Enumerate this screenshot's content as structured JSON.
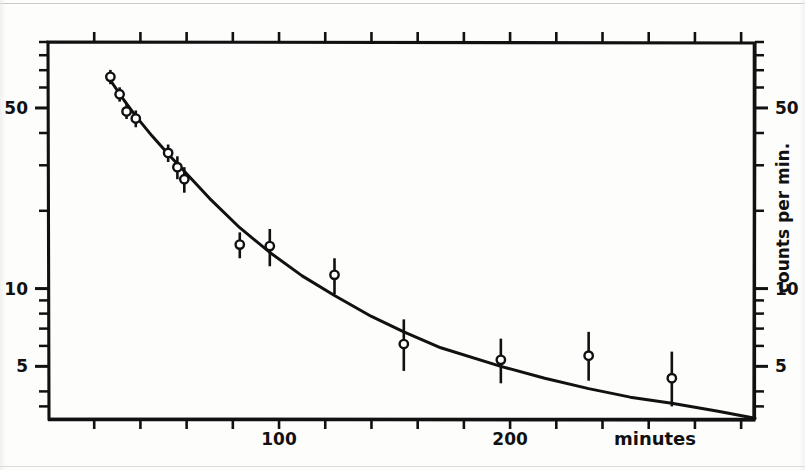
{
  "chart_data": {
    "type": "scatter",
    "title": "",
    "subtitle": "",
    "xlabel": "minutes",
    "ylabel": "counts per min.",
    "yscale": "log",
    "xscale": "linear",
    "grid": false,
    "legend": null,
    "xlim": [
      0,
      306
    ],
    "ylim": [
      3.1,
      90
    ],
    "x_ticks_labeled": [
      {
        "value": 100,
        "label": "100"
      },
      {
        "value": 200,
        "label": "200"
      }
    ],
    "x_ticks_minor": [
      20,
      40,
      60,
      80,
      100,
      120,
      140,
      160,
      180,
      200,
      220,
      240,
      260,
      280,
      300
    ],
    "y_ticks_labeled_left": [
      {
        "value": 50,
        "label": "50"
      },
      {
        "value": 10,
        "label": "10"
      },
      {
        "value": 5,
        "label": "5"
      }
    ],
    "y_ticks_labeled_right": [
      {
        "value": 50,
        "label": "50"
      },
      {
        "value": 10,
        "label": "10"
      },
      {
        "value": 5,
        "label": "5"
      }
    ],
    "y_ticks_minor": [
      4,
      5,
      6,
      7,
      8,
      9,
      10,
      20,
      30,
      40,
      50,
      60,
      70,
      80
    ],
    "series": [
      {
        "name": "measured counts",
        "marker": "open-circle",
        "errorbars": true,
        "points": [
          {
            "x": 27,
            "y": 66.0,
            "yerr_low": 4.2,
            "yerr_high": 4.2
          },
          {
            "x": 31,
            "y": 56.5,
            "yerr_low": 3.6,
            "yerr_high": 3.6
          },
          {
            "x": 34,
            "y": 48.5,
            "yerr_low": 3.2,
            "yerr_high": 3.2
          },
          {
            "x": 38,
            "y": 45.5,
            "yerr_low": 3.4,
            "yerr_high": 3.4
          },
          {
            "x": 52,
            "y": 33.5,
            "yerr_low": 2.6,
            "yerr_high": 2.6
          },
          {
            "x": 56,
            "y": 29.5,
            "yerr_low": 3.0,
            "yerr_high": 3.0
          },
          {
            "x": 59,
            "y": 26.5,
            "yerr_low": 3.0,
            "yerr_high": 3.0
          },
          {
            "x": 83,
            "y": 14.8,
            "yerr_low": 1.7,
            "yerr_high": 1.7
          },
          {
            "x": 96,
            "y": 14.6,
            "yerr_low": 2.4,
            "yerr_high": 2.4
          },
          {
            "x": 124,
            "y": 11.3,
            "yerr_low": 1.8,
            "yerr_high": 1.8
          },
          {
            "x": 154,
            "y": 6.1,
            "yerr_low": 1.3,
            "yerr_high": 1.5
          },
          {
            "x": 196,
            "y": 5.3,
            "yerr_low": 1.0,
            "yerr_high": 1.1
          },
          {
            "x": 234,
            "y": 5.5,
            "yerr_low": 1.1,
            "yerr_high": 1.3
          },
          {
            "x": 270,
            "y": 4.5,
            "yerr_low": 1.0,
            "yerr_high": 1.2
          }
        ]
      },
      {
        "name": "fitted decay curve",
        "marker": "none",
        "style": "solid-line",
        "points": [
          {
            "x": 27,
            "y": 64.0
          },
          {
            "x": 32,
            "y": 55.0
          },
          {
            "x": 38,
            "y": 46.5
          },
          {
            "x": 45,
            "y": 39.0
          },
          {
            "x": 52,
            "y": 33.2
          },
          {
            "x": 60,
            "y": 27.8
          },
          {
            "x": 70,
            "y": 22.3
          },
          {
            "x": 83,
            "y": 17.2
          },
          {
            "x": 96,
            "y": 13.8
          },
          {
            "x": 110,
            "y": 11.2
          },
          {
            "x": 124,
            "y": 9.4
          },
          {
            "x": 140,
            "y": 7.8
          },
          {
            "x": 154,
            "y": 6.8
          },
          {
            "x": 170,
            "y": 5.9
          },
          {
            "x": 196,
            "y": 5.0
          },
          {
            "x": 215,
            "y": 4.5
          },
          {
            "x": 234,
            "y": 4.1
          },
          {
            "x": 252,
            "y": 3.8
          },
          {
            "x": 270,
            "y": 3.6
          },
          {
            "x": 290,
            "y": 3.35
          },
          {
            "x": 306,
            "y": 3.15
          }
        ]
      }
    ],
    "annotations": []
  },
  "axis_labels": {
    "x_axis": "minutes",
    "y_axis": "counts per min.",
    "x_tick_100": "100",
    "x_tick_200": "200",
    "y_tick_50_left": "50",
    "y_tick_10_left": "10",
    "y_tick_5_left": "5",
    "y_tick_50_right": "50",
    "y_tick_10_right": "10",
    "y_tick_5_right": "5"
  },
  "style": {
    "ink": "#111111",
    "paper": "#fdfdfc",
    "marker_fill": "#ffffff"
  }
}
